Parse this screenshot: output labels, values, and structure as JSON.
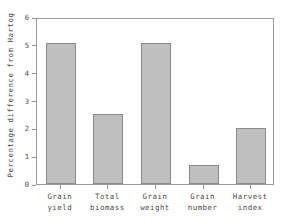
{
  "chart_data": {
    "type": "bar",
    "title": "",
    "xlabel": "",
    "ylabel": "Percentage difference from Hartog",
    "categories": [
      "Grain\nyield",
      "Total\nbiomass",
      "Grain\nweight",
      "Grain\nnumber",
      "Harvest\nindex"
    ],
    "category_lines": [
      [
        "Grain",
        "yield"
      ],
      [
        "Total",
        "biomass"
      ],
      [
        "Grain",
        "weight"
      ],
      [
        "Grain",
        "number"
      ],
      [
        "Harvest",
        "index"
      ]
    ],
    "values": [
      5.05,
      2.5,
      5.05,
      0.7,
      2.0
    ],
    "ylim": [
      0,
      6
    ],
    "yticks": [
      0,
      1,
      2,
      3,
      4,
      5,
      6
    ],
    "ytick_labels": [
      "0",
      "1",
      "2",
      "3",
      "4",
      "5",
      "6"
    ],
    "grid": false,
    "legend": null,
    "colors": {
      "bar_fill": "#bfbfbf",
      "bar_edge": "#8a8a8a",
      "axis": "#8f8f8f",
      "text": "#4a4a4a",
      "background": "#ffffff"
    }
  }
}
